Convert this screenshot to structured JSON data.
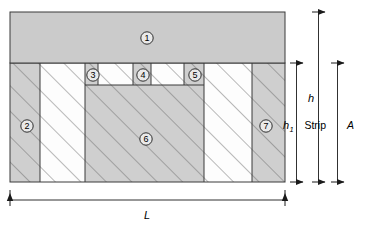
{
  "figure": {
    "colors": {
      "fill_gray": "#cfcfcf",
      "fill_white": "#fdfdfd",
      "top_block_gray": "#cbcbcb",
      "outline": "#3a3a3a",
      "hatch": "#8a8a8a",
      "text": "#000000"
    },
    "regions": [
      {
        "id": "1",
        "label": "1",
        "kind": "top-block",
        "fill": "gray",
        "hatched": false
      },
      {
        "id": "2",
        "label": "2",
        "kind": "left-column",
        "fill": "gray",
        "hatched": true
      },
      {
        "id": "3",
        "label": "3",
        "kind": "upper-band-cell",
        "fill": "gray",
        "hatched": true
      },
      {
        "id": "4",
        "label": "4",
        "kind": "upper-band-cell",
        "fill": "gray",
        "hatched": true
      },
      {
        "id": "5",
        "label": "5",
        "kind": "upper-band-cell",
        "fill": "gray",
        "hatched": true
      },
      {
        "id": "6",
        "label": "6",
        "kind": "center-block",
        "fill": "gray",
        "hatched": true
      },
      {
        "id": "7",
        "label": "7",
        "kind": "right-column",
        "fill": "gray",
        "hatched": true
      }
    ],
    "dimensions": [
      {
        "id": "h1",
        "label": "h",
        "subscript": "1",
        "orientation": "vertical",
        "name": "h-sub-1"
      },
      {
        "id": "h",
        "label": "h",
        "subscript": "",
        "orientation": "vertical",
        "name": "h"
      },
      {
        "id": "stripA",
        "label": "Strip",
        "italic_part": "A",
        "orientation": "vertical",
        "name": "strip-a"
      },
      {
        "id": "L",
        "label": "L",
        "subscript": "",
        "orientation": "horizontal",
        "name": "length-L"
      }
    ]
  }
}
